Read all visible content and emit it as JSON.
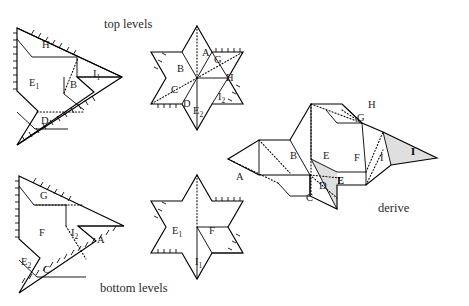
{
  "figure": {
    "width": 469,
    "height": 306,
    "background": "#ffffff",
    "ink": "#000000",
    "shade_color": "#d9d9d9"
  },
  "captions": [
    {
      "id": "top-levels",
      "text": "top levels",
      "x": 104,
      "y": 28
    },
    {
      "id": "bottom-levels",
      "text": "bottom levels",
      "x": 100,
      "y": 292
    },
    {
      "id": "derive",
      "text": "derive",
      "x": 378,
      "y": 212
    }
  ],
  "panels": {
    "top_left": {
      "name": "top-levels-triangle",
      "labels": [
        {
          "text": "H",
          "sub": "",
          "x": 42,
          "y": 48
        },
        {
          "text": "E",
          "sub": "1",
          "x": 33,
          "y": 83
        },
        {
          "text": "B",
          "sub": "",
          "x": 73,
          "y": 85
        },
        {
          "text": "I",
          "sub": "1",
          "x": 96,
          "y": 74
        },
        {
          "text": "D",
          "sub": "",
          "x": 42,
          "y": 121
        }
      ]
    },
    "top_middle": {
      "name": "top-levels-star",
      "labels": [
        {
          "text": "A",
          "sub": "",
          "x": 205,
          "y": 53
        },
        {
          "text": "G",
          "sub": "",
          "x": 216,
          "y": 60
        },
        {
          "text": "B",
          "sub": "",
          "x": 180,
          "y": 68
        },
        {
          "text": "H",
          "sub": "",
          "x": 228,
          "y": 78
        },
        {
          "text": "C",
          "sub": "",
          "x": 174,
          "y": 90
        },
        {
          "text": "I",
          "sub": "2",
          "x": 222,
          "y": 97
        },
        {
          "text": "D",
          "sub": "",
          "x": 186,
          "y": 104
        },
        {
          "text": "E",
          "sub": "2",
          "x": 197,
          "y": 111
        }
      ]
    },
    "bottom_left": {
      "name": "bottom-levels-triangle",
      "labels": [
        {
          "text": "G",
          "sub": "",
          "x": 42,
          "y": 196
        },
        {
          "text": "F",
          "sub": "",
          "x": 42,
          "y": 233
        },
        {
          "text": "I",
          "sub": "2",
          "x": 74,
          "y": 233
        },
        {
          "text": "A",
          "sub": "",
          "x": 100,
          "y": 241
        },
        {
          "text": "E",
          "sub": "2",
          "x": 24,
          "y": 262
        },
        {
          "text": "C",
          "sub": "",
          "x": 45,
          "y": 269
        }
      ]
    },
    "bottom_middle": {
      "name": "bottom-levels-star",
      "labels": [
        {
          "text": "E",
          "sub": "1",
          "x": 176,
          "y": 231
        },
        {
          "text": "F",
          "sub": "",
          "x": 212,
          "y": 231
        },
        {
          "text": "I",
          "sub": "1",
          "x": 198,
          "y": 262
        }
      ]
    },
    "right": {
      "name": "derive-net",
      "labels": [
        {
          "text": "H",
          "sub": "",
          "x": 371,
          "y": 105,
          "bold": false
        },
        {
          "text": "G",
          "sub": "",
          "x": 360,
          "y": 118,
          "bold": false
        },
        {
          "text": "B",
          "sub": "",
          "x": 293,
          "y": 155,
          "bold": false
        },
        {
          "text": "E",
          "sub": "",
          "x": 326,
          "y": 155,
          "bold": false
        },
        {
          "text": "F",
          "sub": "",
          "x": 357,
          "y": 157,
          "bold": false
        },
        {
          "text": "I",
          "sub": "",
          "x": 382,
          "y": 157,
          "bold": false
        },
        {
          "text": "I",
          "sub": "",
          "x": 413,
          "y": 151,
          "bold": true
        },
        {
          "text": "A",
          "sub": "",
          "x": 239,
          "y": 176,
          "bold": false
        },
        {
          "text": "D",
          "sub": "",
          "x": 322,
          "y": 185,
          "bold": false
        },
        {
          "text": "E",
          "sub": "",
          "x": 340,
          "y": 180,
          "bold": true
        },
        {
          "text": "C",
          "sub": "",
          "x": 309,
          "y": 197,
          "bold": false
        }
      ]
    }
  }
}
